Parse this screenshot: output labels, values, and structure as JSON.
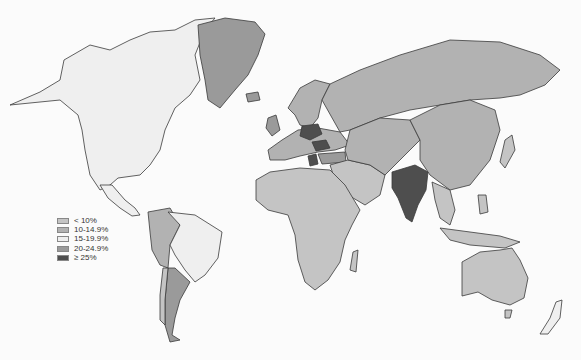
{
  "map": {
    "type": "choropleth",
    "projection": "world",
    "palette": {
      "lt10": "#c4c4c4",
      "10to14_9": "#b2b2b2",
      "15to19_9": "#efefef",
      "20to24_9": "#9a9a9a",
      "gte25": "#4e4e4e"
    }
  },
  "legend": {
    "items": [
      {
        "label": "< 10%",
        "color": "#c4c4c4"
      },
      {
        "label": "10-14.9%",
        "color": "#b2b2b2"
      },
      {
        "label": "15-19.9%",
        "color": "#efefef"
      },
      {
        "label": "20-24.9%",
        "color": "#9a9a9a"
      },
      {
        "label": "≥ 25%",
        "color": "#4e4e4e"
      }
    ]
  },
  "regions": [
    {
      "name": "North America",
      "category": "15-19.9%"
    },
    {
      "name": "Greenland",
      "category": "20-24.9%"
    },
    {
      "name": "Brazil",
      "category": "15-19.9%"
    },
    {
      "name": "Argentina",
      "category": "20-24.9%"
    },
    {
      "name": "Andean South America",
      "category": "10-14.9%"
    },
    {
      "name": "Africa",
      "category": "< 10%"
    },
    {
      "name": "Russia / Central Asia",
      "category": "10-14.9%"
    },
    {
      "name": "China",
      "category": "10-14.9%"
    },
    {
      "name": "India",
      "category": "≥ 25%"
    },
    {
      "name": "Poland",
      "category": "≥ 25%"
    },
    {
      "name": "Romania",
      "category": "≥ 25%"
    },
    {
      "name": "Greece",
      "category": "≥ 25%"
    },
    {
      "name": "Turkey",
      "category": "20-24.9%"
    },
    {
      "name": "United Kingdom",
      "category": "20-24.9%"
    },
    {
      "name": "Australia",
      "category": "< 10%"
    },
    {
      "name": "Southeast Asia",
      "category": "< 10%"
    }
  ]
}
